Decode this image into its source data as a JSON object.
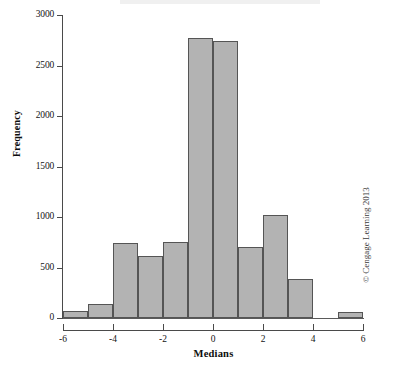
{
  "figure": {
    "credit": "© Cengage Learning 2013"
  },
  "chart_data": {
    "type": "bar",
    "title": "",
    "subtitle": "",
    "xlabel": "Medians",
    "ylabel": "Frequency",
    "xlim": [
      -6,
      6
    ],
    "ylim": [
      0,
      3000
    ],
    "grid": false,
    "legend": false,
    "bin_width": 1,
    "bar_fill": "#b3b3b3",
    "bar_edge": "#555555",
    "xticks": [
      -6,
      -4,
      -2,
      0,
      2,
      4,
      6
    ],
    "xtick_labels": [
      "-6",
      "-4",
      "-2",
      "0",
      "2",
      "4",
      "6"
    ],
    "yticks": [
      0,
      500,
      1000,
      1500,
      2000,
      2500,
      3000
    ],
    "ytick_labels": [
      "0",
      "500",
      "1000",
      "1500",
      "2000",
      "2500",
      "3000"
    ],
    "bin_edges": [
      -6,
      -5,
      -4,
      -3,
      -2,
      -1,
      0,
      1,
      2,
      3,
      4,
      5,
      6
    ],
    "categories": [
      "-6 to -5",
      "-5 to -4",
      "-4 to -3",
      "-3 to -2",
      "-2 to -1",
      "-1 to 0",
      "0 to 1",
      "1 to 2",
      "2 to 3",
      "3 to 4",
      "4 to 5",
      "5 to 6"
    ],
    "values": [
      70,
      140,
      740,
      615,
      750,
      2775,
      2745,
      700,
      1020,
      390,
      0,
      60
    ]
  }
}
